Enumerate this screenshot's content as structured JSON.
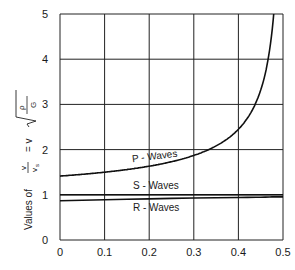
{
  "chart_data": {
    "type": "line",
    "title": "",
    "xlabel": "",
    "ylabel": {
      "prefix": "Values of",
      "frac_num": "v",
      "frac_den": "v",
      "frac_den_sub": "s",
      "eq": "= v",
      "sqrt_num": "ρ",
      "sqrt_den": "G"
    },
    "xlim": [
      0,
      0.5
    ],
    "ylim": [
      0,
      5
    ],
    "xticks": [
      0,
      0.1,
      0.2,
      0.3,
      0.4,
      0.5
    ],
    "xtick_labels": [
      "0",
      "0.1",
      "0.2",
      "0.3",
      "0.4",
      "0.5"
    ],
    "yticks": [
      0,
      1,
      2,
      3,
      4,
      5
    ],
    "ytick_labels": [
      "0",
      "1",
      "2",
      "3",
      "4",
      "5"
    ],
    "grid": true,
    "x": [
      0,
      0.05,
      0.1,
      0.15,
      0.2,
      0.25,
      0.3,
      0.35,
      0.4,
      0.42,
      0.44,
      0.45,
      0.46,
      0.47,
      0.475
    ],
    "series": [
      {
        "name": "P - Waves",
        "values": [
          1.41,
          1.45,
          1.5,
          1.56,
          1.63,
          1.73,
          1.87,
          2.08,
          2.45,
          2.69,
          3.06,
          3.32,
          3.69,
          4.27,
          4.58
        ]
      },
      {
        "name": "S - Waves",
        "values": [
          1,
          1,
          1,
          1,
          1,
          1,
          1,
          1,
          1,
          1,
          1,
          1,
          1,
          1,
          1
        ]
      },
      {
        "name": "R - Waves",
        "values": [
          0.87,
          0.88,
          0.89,
          0.9,
          0.91,
          0.92,
          0.93,
          0.935,
          0.94,
          0.943,
          0.946,
          0.948,
          0.95,
          0.952,
          0.953
        ]
      }
    ],
    "annotations": [
      "P - Waves",
      "S - Waves",
      "R - Waves"
    ]
  }
}
